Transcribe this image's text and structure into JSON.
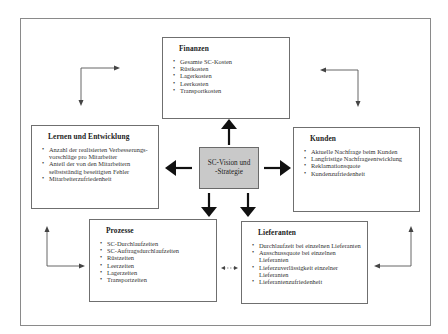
{
  "diagram": {
    "center": {
      "label_line1": "SC-Vision und",
      "label_line2": "-Strategie",
      "fill": "#c9c9c9"
    },
    "boxes": [
      {
        "id": "finanzen",
        "title": "Finanzen",
        "items": [
          "Gesamte SC-Kosten",
          "Rüstkosten",
          "Lagerkosten",
          "Leerkosten",
          "Transportkosten"
        ]
      },
      {
        "id": "kunden",
        "title": "Kunden",
        "items": [
          "Aktuelle Nachfrage beim Kunden",
          "Langfristige Nachfrageentwicklung",
          "Reklamationsquote",
          "Kundenzufriedenheit"
        ]
      },
      {
        "id": "lernen",
        "title": "Lernen und Entwicklung",
        "items": [
          "Anzahl der realisierten Verbesserungs-vorschläge pro Mitarbeiter",
          "Anteil der von den Mitarbeitern selbstständig beseitigten Fehler",
          "Mitarbeiterzufriedenheit"
        ]
      },
      {
        "id": "prozesse",
        "title": "Prozesse",
        "items": [
          "SC-Durchlaufzeiten",
          "SC-Auftragsdurchlaufzeiten",
          "Rüstzeiten",
          "Leerzeiten",
          "Lagerzeiten",
          "Transportzeiten"
        ]
      },
      {
        "id": "lieferanten",
        "title": "Lieferanten",
        "items": [
          "Durchlaufzeit bei einzelnen Lieferanten",
          "Ausschussquote bei einzelnen Lieferanten",
          "Lieferzuverlässigkeit einzelner Lieferanten",
          "Lieferantenzufriedenheit"
        ]
      }
    ],
    "colors": {
      "border": "#6f6f6f",
      "frame": "#8a8a8a",
      "arrow": "#111111",
      "connector": "#555555"
    }
  }
}
